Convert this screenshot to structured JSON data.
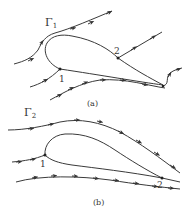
{
  "figure": {
    "panels": [
      {
        "id": "a",
        "caption": "(a)",
        "circulation_label": "Γ",
        "circulation_subscript": "1",
        "point_labels": [
          "1",
          "2"
        ]
      },
      {
        "id": "b",
        "caption": "(b)",
        "circulation_label": "Γ",
        "circulation_subscript": "2",
        "point_labels": [
          "1",
          "2"
        ]
      }
    ],
    "colors": {
      "line": "#3a3a3a",
      "text": "#333333",
      "background": "#ffffff"
    }
  }
}
